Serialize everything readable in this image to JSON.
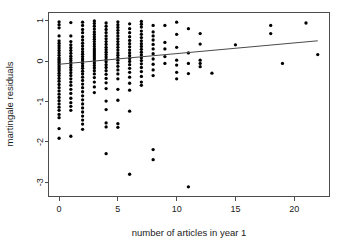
{
  "chart_data": {
    "type": "scatter",
    "title": "",
    "xlabel": "number of articles in year 1",
    "ylabel": "martingale residuals",
    "xlim": [
      -0.9,
      23.0
    ],
    "ylim": [
      -3.35,
      1.2
    ],
    "xticks": [
      0,
      5,
      10,
      15,
      20
    ],
    "xtick_labels": [
      "0",
      "5",
      "10",
      "15",
      "20"
    ],
    "yticks": [
      1,
      0,
      -1,
      -2,
      -3
    ],
    "ytick_labels": [
      "1",
      "0",
      "-1",
      "-2",
      "-3"
    ],
    "grid": false,
    "legend": "none",
    "frame": "box",
    "point_color": "#000000",
    "point_size": 2.2,
    "fit_line": {
      "name": "lowess smooth",
      "color": "#4a4a4a",
      "x": [
        0.0,
        22.0
      ],
      "y": [
        -0.08,
        0.5
      ]
    },
    "series": [
      {
        "name": "martingale residuals",
        "points": [
          [
            0,
            0.97
          ],
          [
            0,
            0.9
          ],
          [
            0,
            0.82
          ],
          [
            0,
            0.62
          ],
          [
            0,
            0.5
          ],
          [
            0,
            0.44
          ],
          [
            0,
            0.38
          ],
          [
            0,
            0.32
          ],
          [
            0,
            0.26
          ],
          [
            0,
            0.2
          ],
          [
            0,
            0.14
          ],
          [
            0,
            0.08
          ],
          [
            0,
            0.04
          ],
          [
            0,
            0.0
          ],
          [
            0,
            -0.04
          ],
          [
            0,
            -0.09
          ],
          [
            0,
            -0.14
          ],
          [
            0,
            -0.19
          ],
          [
            0,
            -0.24
          ],
          [
            0,
            -0.3
          ],
          [
            0,
            -0.36
          ],
          [
            0,
            -0.43
          ],
          [
            0,
            -0.5
          ],
          [
            0,
            -0.58
          ],
          [
            0,
            -0.66
          ],
          [
            0,
            -0.74
          ],
          [
            0,
            -0.82
          ],
          [
            0,
            -0.9
          ],
          [
            0,
            -0.98
          ],
          [
            0,
            -1.06
          ],
          [
            0,
            -1.14
          ],
          [
            0,
            -1.22
          ],
          [
            0,
            -1.32
          ],
          [
            0,
            -1.4
          ],
          [
            0,
            -1.67
          ],
          [
            0,
            -1.91
          ],
          [
            1,
            0.95
          ],
          [
            1,
            0.62
          ],
          [
            1,
            0.48
          ],
          [
            1,
            0.4
          ],
          [
            1,
            0.33
          ],
          [
            1,
            0.26
          ],
          [
            1,
            0.19
          ],
          [
            1,
            0.12
          ],
          [
            1,
            0.06
          ],
          [
            1,
            0.01
          ],
          [
            1,
            -0.04
          ],
          [
            1,
            -0.1
          ],
          [
            1,
            -0.16
          ],
          [
            1,
            -0.22
          ],
          [
            1,
            -0.29
          ],
          [
            1,
            -0.36
          ],
          [
            1,
            -0.44
          ],
          [
            1,
            -0.52
          ],
          [
            1,
            -0.6
          ],
          [
            1,
            -0.7
          ],
          [
            1,
            -0.8
          ],
          [
            1,
            -0.92
          ],
          [
            1,
            -1.03
          ],
          [
            1,
            -1.12
          ],
          [
            1,
            -1.22
          ],
          [
            1,
            -1.86
          ],
          [
            2,
            0.96
          ],
          [
            2,
            0.88
          ],
          [
            2,
            0.78
          ],
          [
            2,
            0.7
          ],
          [
            2,
            0.6
          ],
          [
            2,
            0.52
          ],
          [
            2,
            0.44
          ],
          [
            2,
            0.37
          ],
          [
            2,
            0.3
          ],
          [
            2,
            0.23
          ],
          [
            2,
            0.17
          ],
          [
            2,
            0.11
          ],
          [
            2,
            0.05
          ],
          [
            2,
            0.0
          ],
          [
            2,
            -0.06
          ],
          [
            2,
            -0.12
          ],
          [
            2,
            -0.18
          ],
          [
            2,
            -0.25
          ],
          [
            2,
            -0.32
          ],
          [
            2,
            -0.4
          ],
          [
            2,
            -0.48
          ],
          [
            2,
            -0.57
          ],
          [
            2,
            -0.66
          ],
          [
            2,
            -0.76
          ],
          [
            2,
            -0.86
          ],
          [
            2,
            -0.96
          ],
          [
            2,
            -1.06
          ],
          [
            2,
            -1.16
          ],
          [
            2,
            -1.26
          ],
          [
            2,
            -1.36
          ],
          [
            2,
            -1.46
          ],
          [
            2,
            -1.56
          ],
          [
            2,
            -1.69
          ],
          [
            3,
            0.99
          ],
          [
            3,
            0.93
          ],
          [
            3,
            0.86
          ],
          [
            3,
            0.79
          ],
          [
            3,
            0.72
          ],
          [
            3,
            0.66
          ],
          [
            3,
            0.6
          ],
          [
            3,
            0.54
          ],
          [
            3,
            0.48
          ],
          [
            3,
            0.42
          ],
          [
            3,
            0.36
          ],
          [
            3,
            0.3
          ],
          [
            3,
            0.25
          ],
          [
            3,
            0.2
          ],
          [
            3,
            0.15
          ],
          [
            3,
            0.1
          ],
          [
            3,
            0.05
          ],
          [
            3,
            0.0
          ],
          [
            3,
            -0.05
          ],
          [
            3,
            -0.11
          ],
          [
            3,
            -0.17
          ],
          [
            3,
            -0.24
          ],
          [
            3,
            -0.32
          ],
          [
            3,
            -0.41
          ],
          [
            3,
            -0.52
          ],
          [
            3,
            -0.64
          ],
          [
            3,
            -0.78
          ],
          [
            4,
            0.94
          ],
          [
            4,
            0.86
          ],
          [
            4,
            0.78
          ],
          [
            4,
            0.7
          ],
          [
            4,
            0.62
          ],
          [
            4,
            0.55
          ],
          [
            4,
            0.48
          ],
          [
            4,
            0.41
          ],
          [
            4,
            0.34
          ],
          [
            4,
            0.28
          ],
          [
            4,
            0.22
          ],
          [
            4,
            0.16
          ],
          [
            4,
            0.1
          ],
          [
            4,
            0.04
          ],
          [
            4,
            -0.02
          ],
          [
            4,
            -0.09
          ],
          [
            4,
            -0.16
          ],
          [
            4,
            -0.24
          ],
          [
            4,
            -0.33
          ],
          [
            4,
            -0.43
          ],
          [
            4,
            -0.54
          ],
          [
            4,
            -0.68
          ],
          [
            4,
            -0.99
          ],
          [
            4,
            -1.2
          ],
          [
            4,
            -1.53
          ],
          [
            4,
            -1.63
          ],
          [
            4,
            -2.29
          ],
          [
            5,
            0.97
          ],
          [
            5,
            0.9
          ],
          [
            5,
            0.83
          ],
          [
            5,
            0.76
          ],
          [
            5,
            0.69
          ],
          [
            5,
            0.62
          ],
          [
            5,
            0.55
          ],
          [
            5,
            0.48
          ],
          [
            5,
            0.41
          ],
          [
            5,
            0.34
          ],
          [
            5,
            0.27
          ],
          [
            5,
            0.2
          ],
          [
            5,
            0.14
          ],
          [
            5,
            0.08
          ],
          [
            5,
            0.02
          ],
          [
            5,
            -0.05
          ],
          [
            5,
            -0.13
          ],
          [
            5,
            -0.22
          ],
          [
            5,
            -0.32
          ],
          [
            5,
            -0.44
          ],
          [
            5,
            -0.7
          ],
          [
            5,
            -0.97
          ],
          [
            5,
            -1.55
          ],
          [
            5,
            -1.64
          ],
          [
            6,
            0.92
          ],
          [
            6,
            0.8
          ],
          [
            6,
            0.7
          ],
          [
            6,
            0.6
          ],
          [
            6,
            0.51
          ],
          [
            6,
            0.43
          ],
          [
            6,
            0.35
          ],
          [
            6,
            0.27
          ],
          [
            6,
            0.2
          ],
          [
            6,
            0.13
          ],
          [
            6,
            0.06
          ],
          [
            6,
            -0.01
          ],
          [
            6,
            -0.09
          ],
          [
            6,
            -0.18
          ],
          [
            6,
            -0.28
          ],
          [
            6,
            -0.4
          ],
          [
            6,
            -0.55
          ],
          [
            6,
            -0.72
          ],
          [
            6,
            -1.24
          ],
          [
            6,
            -2.8
          ],
          [
            7,
            0.98
          ],
          [
            7,
            0.91
          ],
          [
            7,
            0.84
          ],
          [
            7,
            0.74
          ],
          [
            7,
            0.66
          ],
          [
            7,
            0.58
          ],
          [
            7,
            0.5
          ],
          [
            7,
            0.43
          ],
          [
            7,
            0.36
          ],
          [
            7,
            0.29
          ],
          [
            7,
            0.22
          ],
          [
            7,
            0.15
          ],
          [
            7,
            0.08
          ],
          [
            7,
            0.01
          ],
          [
            7,
            -0.07
          ],
          [
            7,
            -0.16
          ],
          [
            7,
            -0.26
          ],
          [
            7,
            -0.38
          ],
          [
            7,
            -0.52
          ],
          [
            7,
            -0.6
          ],
          [
            8,
            0.88
          ],
          [
            8,
            0.72
          ],
          [
            8,
            0.62
          ],
          [
            8,
            0.52
          ],
          [
            8,
            0.41
          ],
          [
            8,
            0.3
          ],
          [
            8,
            0.18
          ],
          [
            8,
            0.05
          ],
          [
            8,
            -0.08
          ],
          [
            8,
            -0.22
          ],
          [
            8,
            -0.36
          ],
          [
            8,
            -2.19
          ],
          [
            8,
            -2.44
          ],
          [
            9,
            0.88
          ],
          [
            9,
            0.46
          ],
          [
            9,
            0.3
          ],
          [
            9,
            0.11
          ],
          [
            9,
            -0.06
          ],
          [
            10,
            0.96
          ],
          [
            10,
            0.66
          ],
          [
            10,
            0.34
          ],
          [
            10,
            0.02
          ],
          [
            10,
            -0.1
          ],
          [
            10,
            -0.28
          ],
          [
            10,
            -0.44
          ],
          [
            11,
            0.8
          ],
          [
            11,
            0.2
          ],
          [
            11,
            -0.06
          ],
          [
            11,
            -0.31
          ],
          [
            11,
            -3.11
          ],
          [
            12,
            0.68
          ],
          [
            12,
            0.42
          ],
          [
            12,
            0.02
          ],
          [
            12,
            -0.06
          ],
          [
            12,
            -0.14
          ],
          [
            13,
            -0.3
          ],
          [
            15,
            0.4
          ],
          [
            18,
            0.88
          ],
          [
            18,
            0.68
          ],
          [
            19,
            -0.06
          ],
          [
            21,
            0.94
          ],
          [
            22,
            0.16
          ]
        ]
      }
    ]
  },
  "axes": {
    "x_axis_name": "x-axis",
    "y_axis_name": "y-axis"
  }
}
